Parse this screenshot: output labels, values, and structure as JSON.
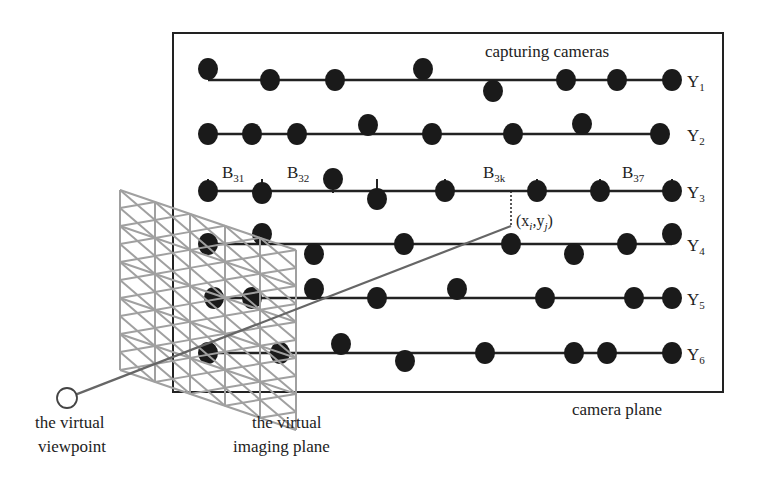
{
  "diagram": {
    "camera_plane_box": {
      "x": 173,
      "y": 33,
      "w": 550,
      "h": 359
    },
    "labels": {
      "capturing_cameras": "capturing cameras",
      "camera_plane": "camera plane",
      "virtual_viewpoint_line1": "the virtual",
      "virtual_viewpoint_line2": "viewpoint",
      "virtual_imaging_plane_line1": "the virtual",
      "virtual_imaging_plane_line2": "imaging plane",
      "point_label": "(x",
      "point_i": "i",
      "point_mid": ",y",
      "point_j": "j",
      "point_close": ")"
    },
    "rows": [
      {
        "name": "Y",
        "sub": "1",
        "y": 80,
        "x_start": 208,
        "x_end": 672,
        "cameras": [
          [
            208,
            69
          ],
          [
            270,
            80
          ],
          [
            335,
            80
          ],
          [
            423,
            69
          ],
          [
            493,
            91
          ],
          [
            566,
            80
          ],
          [
            617,
            80
          ],
          [
            672,
            80
          ]
        ]
      },
      {
        "name": "Y",
        "sub": "2",
        "y": 134,
        "x_start": 208,
        "x_end": 660,
        "cameras": [
          [
            208,
            134
          ],
          [
            252,
            134
          ],
          [
            297,
            134
          ],
          [
            368,
            125
          ],
          [
            432,
            134
          ],
          [
            513,
            134
          ],
          [
            582,
            124
          ],
          [
            660,
            134
          ]
        ]
      },
      {
        "name": "Y",
        "sub": "3",
        "y": 191,
        "x_start": 208,
        "x_end": 672,
        "cameras": [
          [
            208,
            191
          ],
          [
            262,
            193
          ],
          [
            333,
            179
          ],
          [
            377,
            199
          ],
          [
            445,
            191
          ],
          [
            537,
            191
          ],
          [
            600,
            191
          ],
          [
            672,
            191
          ]
        ],
        "ticks": [
          208,
          262,
          333,
          377,
          445,
          537,
          600,
          672
        ]
      },
      {
        "name": "Y",
        "sub": "4",
        "y": 244,
        "x_start": 208,
        "x_end": 672,
        "cameras": [
          [
            208,
            244
          ],
          [
            262,
            234
          ],
          [
            314,
            254
          ],
          [
            404,
            244
          ],
          [
            511,
            244
          ],
          [
            574,
            254
          ],
          [
            627,
            244
          ],
          [
            672,
            234
          ]
        ]
      },
      {
        "name": "Y",
        "sub": "5",
        "y": 298,
        "x_start": 214,
        "x_end": 672,
        "cameras": [
          [
            214,
            298
          ],
          [
            252,
            298
          ],
          [
            314,
            289
          ],
          [
            377,
            298
          ],
          [
            457,
            289
          ],
          [
            545,
            298
          ],
          [
            634,
            298
          ],
          [
            672,
            298
          ]
        ]
      },
      {
        "name": "Y",
        "sub": "6",
        "y": 353,
        "x_start": 208,
        "x_end": 672,
        "cameras": [
          [
            208,
            353
          ],
          [
            280,
            353
          ],
          [
            341,
            344
          ],
          [
            405,
            361
          ],
          [
            485,
            353
          ],
          [
            574,
            353
          ],
          [
            607,
            353
          ],
          [
            672,
            353
          ]
        ]
      }
    ],
    "block_labels": [
      {
        "main": "B",
        "sub": "31",
        "x": 222,
        "y": 178
      },
      {
        "main": "B",
        "sub": "32",
        "x": 287,
        "y": 178
      },
      {
        "main": "B",
        "sub": "3k",
        "x": 483,
        "y": 178
      },
      {
        "main": "B",
        "sub": "37",
        "x": 622,
        "y": 178
      }
    ],
    "viewpoint": {
      "cx": 67,
      "cy": 398,
      "r": 10
    },
    "intersection_point": {
      "x": 511,
      "y": 226
    },
    "colors": {
      "camera": "#1a1a1a",
      "line": "#222222",
      "grid": "#a0a0a0",
      "ray": "#666666"
    }
  }
}
